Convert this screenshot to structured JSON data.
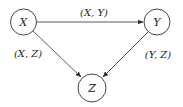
{
  "diagram": {
    "nodes": [
      {
        "id": "X",
        "label": "X",
        "cx": 23.5,
        "cy": 22,
        "r": 13
      },
      {
        "id": "Y",
        "label": "Y",
        "cx": 157,
        "cy": 22,
        "r": 13
      },
      {
        "id": "Z",
        "label": "Z",
        "cx": 92,
        "cy": 88,
        "r": 14
      }
    ],
    "edges": [
      {
        "from": "X",
        "to": "Y",
        "label": "(X, Y)"
      },
      {
        "from": "X",
        "to": "Z",
        "label": "(X, Z)"
      },
      {
        "from": "Y",
        "to": "Z",
        "label": "(Y, Z)"
      }
    ],
    "colors": {
      "stroke": "#333333",
      "background": "#ffffff"
    }
  }
}
